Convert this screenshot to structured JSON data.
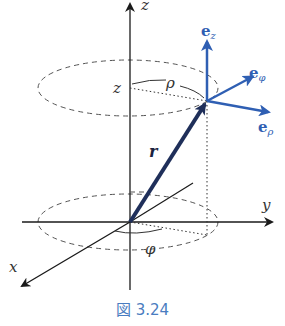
{
  "figure": {
    "caption": "図 3.24",
    "axes": {
      "x_label": "x",
      "y_label": "y",
      "z_label": "z"
    },
    "labels": {
      "z_height": "z",
      "rho": "ρ",
      "phi": "φ",
      "position_vector": "r"
    },
    "unit_vectors": {
      "e_z": {
        "base": "e",
        "sub": "z"
      },
      "e_phi": {
        "base": "e",
        "sub": "φ"
      },
      "e_rho": {
        "base": "e",
        "sub": "ρ"
      }
    },
    "colors": {
      "axes": "#1a1a1a",
      "position_vector": "#1f2f5a",
      "unit_vectors": "#2f5fb3",
      "caption": "#4a7cc0",
      "dashed": "#555555"
    }
  }
}
